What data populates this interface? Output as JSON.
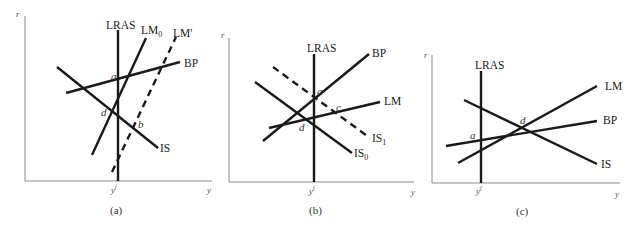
{
  "panels": [
    {
      "caption": "(a)",
      "axis_y_label": "r",
      "axis_x_label": "y",
      "tick_label": "y",
      "tick_sup": "f",
      "curves": {
        "lras": "LRAS",
        "lm0": "LM",
        "lm0_sub": "0",
        "lm_prime": "LM'",
        "bp": "BP",
        "is": "IS"
      },
      "points": {
        "a": "a",
        "d": "d",
        "b": "b"
      }
    },
    {
      "caption": "(b)",
      "axis_y_label": "r",
      "axis_x_label": "y",
      "tick_label": "y",
      "tick_sup": "f",
      "curves": {
        "lras": "LRAS",
        "bp": "BP",
        "lm": "LM",
        "is1": "IS",
        "is1_sub": "1",
        "is0": "IS",
        "is0_sub": "0"
      },
      "points": {
        "a": "a",
        "c": "c",
        "d": "d"
      }
    },
    {
      "caption": "(c)",
      "axis_y_label": "r",
      "axis_x_label": "y",
      "tick_label": "y",
      "tick_sup": "f",
      "curves": {
        "lras": "LRAS",
        "lm": "LM",
        "bp": "BP",
        "is": "IS"
      },
      "points": {
        "a": "a",
        "d": "d"
      }
    }
  ]
}
